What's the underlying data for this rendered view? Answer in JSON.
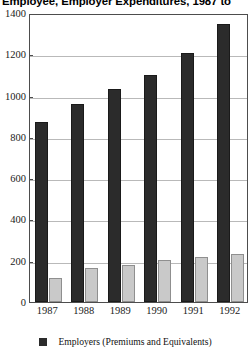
{
  "chart_data": {
    "type": "bar",
    "title": "Employee, Employer Expenditures, 1987 to",
    "xlabel": "",
    "ylabel": "",
    "categories": [
      "1987",
      "1988",
      "1989",
      "1990",
      "1991",
      "1992"
    ],
    "ylim": [
      0,
      1400
    ],
    "yticks": [
      0,
      200,
      400,
      600,
      800,
      1000,
      1200,
      1400
    ],
    "ytick_labels": [
      "0",
      "200",
      "400",
      "600",
      "800",
      "1000",
      "1200",
      "1400"
    ],
    "grid": true,
    "legend_position": "bottom-center",
    "series": [
      {
        "name": "Employers (Premiums and Equivalents)",
        "color": "#2b2b2b",
        "in_legend": true,
        "values": [
          870,
          960,
          1030,
          1100,
          1205,
          1345
        ]
      },
      {
        "name": "",
        "color": "#c9c9c9",
        "in_legend": false,
        "values": [
          118,
          165,
          180,
          205,
          220,
          235
        ]
      }
    ]
  },
  "legend": {
    "items": [
      {
        "label": "Employers (Premiums and Equivalents)",
        "swatch_color": "#2b2b2b"
      }
    ]
  }
}
